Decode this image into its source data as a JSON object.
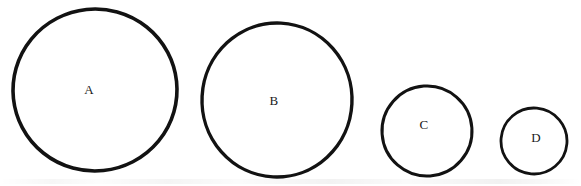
{
  "figure": {
    "width": 581,
    "height": 186,
    "background_color": "#ffffff",
    "stroke_color": "#121212",
    "fill_color": "#ffffff",
    "label_color": "#1a1a1a",
    "caption": ""
  },
  "chart_data": {
    "type": "scatter",
    "title": "",
    "xlabel": "",
    "ylabel": "",
    "grid": false,
    "legend": "none",
    "categories": [
      "A",
      "B",
      "C",
      "D"
    ],
    "values": [
      82,
      76,
      45,
      33
    ],
    "value_unit": "radius-px",
    "xlim": [
      0,
      581
    ],
    "ylim": [
      0,
      186
    ]
  },
  "shapes": [
    {
      "id": "circle-a",
      "label": "A",
      "cx": 95,
      "cy": 90,
      "rx": 82,
      "ry": 81,
      "stroke_width": 3.6,
      "label_x": 89,
      "label_y": 89
    },
    {
      "id": "circle-b",
      "label": "B",
      "cx": 277,
      "cy": 100,
      "rx": 75,
      "ry": 77,
      "stroke_width": 3.4,
      "label_x": 274,
      "label_y": 100
    },
    {
      "id": "circle-c",
      "label": "C",
      "cx": 427,
      "cy": 131,
      "rx": 45,
      "ry": 45,
      "stroke_width": 3.0,
      "label_x": 424,
      "label_y": 124
    },
    {
      "id": "circle-d",
      "label": "D",
      "cx": 534,
      "cy": 141,
      "rx": 33,
      "ry": 33,
      "stroke_width": 2.8,
      "label_x": 536,
      "label_y": 137
    }
  ]
}
